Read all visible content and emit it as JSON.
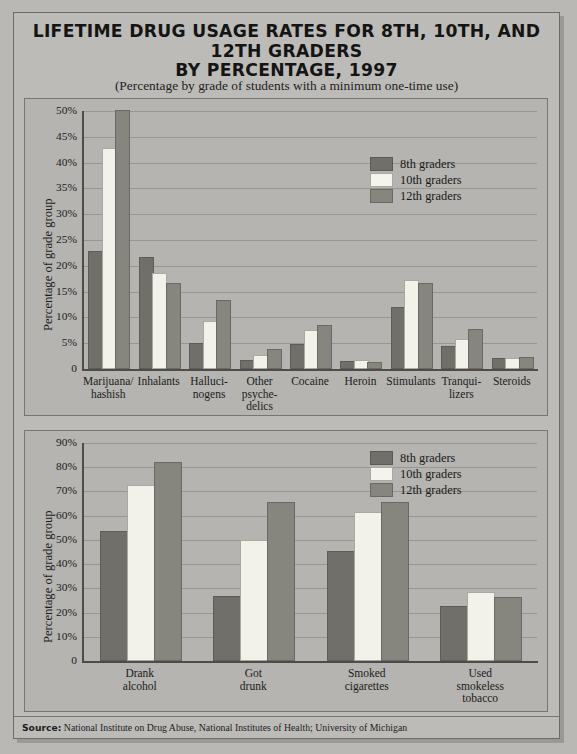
{
  "title": {
    "line1": "LIFETIME DRUG USAGE RATES FOR 8TH, 10TH, AND 12TH GRADERS",
    "line2": "BY PERCENTAGE, 1997",
    "subtitle": "(Percentage by grade of students with a minimum one-time use)"
  },
  "source": {
    "label": "Source:",
    "text": "National Institute on Drug Abuse, National Institutes of Health; University of Michigan"
  },
  "colors": {
    "series_8th": "#706f6a",
    "series_10th": "#f2f1ea",
    "series_12th": "#86857e",
    "background": "#b9b8b4",
    "plot_background": "#b5b4b0",
    "gridline": "#98978f",
    "axis": "#4d4c48"
  },
  "chart_data": [
    {
      "id": "illicit-drugs",
      "type": "bar",
      "title": "LIFETIME DRUG USAGE RATES FOR 8TH, 10TH, AND 12TH GRADERS BY PERCENTAGE, 1997",
      "subtitle": "(Percentage by grade of students with a minimum one-time use)",
      "xlabel": "",
      "ylabel": "Percentage of grade group",
      "ylim": [
        0,
        50
      ],
      "ytick_labels": [
        "0",
        "5%",
        "10%",
        "15%",
        "20%",
        "25%",
        "30%",
        "35%",
        "40%",
        "45%",
        "50%"
      ],
      "ytick_values": [
        0,
        5,
        10,
        15,
        20,
        25,
        30,
        35,
        40,
        45,
        50
      ],
      "grid": true,
      "legend_position": "upper-right",
      "categories": [
        "Marijuana/ hashish",
        "Inhalants",
        "Halluci- nogens",
        "Other psyche- delics",
        "Cocaine",
        "Heroin",
        "Stimulants",
        "Tranqui- lizers",
        "Steroids"
      ],
      "category_lines": [
        [
          "Marijuana/",
          "hashish"
        ],
        [
          "Inhalants"
        ],
        [
          "Halluci-",
          "nogens"
        ],
        [
          "Other",
          "psyche-",
          "delics"
        ],
        [
          "Cocaine"
        ],
        [
          "Heroin"
        ],
        [
          "Stimulants"
        ],
        [
          "Tranqui-",
          "lizers"
        ],
        [
          "Steroids"
        ]
      ],
      "series": [
        {
          "name": "8th graders",
          "values": [
            22.5,
            21.4,
            4.6,
            1.3,
            4.4,
            1.1,
            11.7,
            4.1,
            1.8
          ]
        },
        {
          "name": "10th graders",
          "values": [
            42.5,
            18.3,
            8.9,
            2.4,
            7.1,
            1.4,
            16.8,
            5.5,
            1.8
          ]
        },
        {
          "name": "12th graders",
          "values": [
            49.8,
            16.3,
            13.0,
            3.5,
            8.1,
            1.0,
            16.2,
            7.4,
            1.9
          ]
        }
      ]
    },
    {
      "id": "alcohol-tobacco",
      "type": "bar",
      "title": "",
      "xlabel": "",
      "ylabel": "Percentage of grade group",
      "ylim": [
        0,
        90
      ],
      "ytick_labels": [
        "0",
        "10%",
        "20%",
        "30%",
        "40%",
        "50%",
        "60%",
        "70%",
        "80%",
        "90%"
      ],
      "ytick_values": [
        0,
        10,
        20,
        30,
        40,
        50,
        60,
        70,
        80,
        90
      ],
      "grid": true,
      "legend_position": "upper-right",
      "categories": [
        "Drank alcohol",
        "Got drunk",
        "Smoked cigarettes",
        "Used smokeless tobacco"
      ],
      "category_lines": [
        [
          "Drank",
          "alcohol"
        ],
        [
          "Got",
          "drunk"
        ],
        [
          "Smoked",
          "cigarettes"
        ],
        [
          "Used",
          "smokeless",
          "tobacco"
        ]
      ],
      "series": [
        {
          "name": "8th graders",
          "values": [
            53.0,
            26.0,
            44.5,
            22.0
          ]
        },
        {
          "name": "10th graders",
          "values": [
            72.0,
            49.0,
            60.5,
            27.5
          ]
        },
        {
          "name": "12th graders",
          "values": [
            81.5,
            65.0,
            65.0,
            25.5
          ]
        }
      ]
    }
  ],
  "legend": {
    "items": [
      {
        "label": "8th graders",
        "color": "#706f6a"
      },
      {
        "label": "10th graders",
        "color": "#f2f1ea"
      },
      {
        "label": "12th graders",
        "color": "#86857e"
      }
    ]
  }
}
